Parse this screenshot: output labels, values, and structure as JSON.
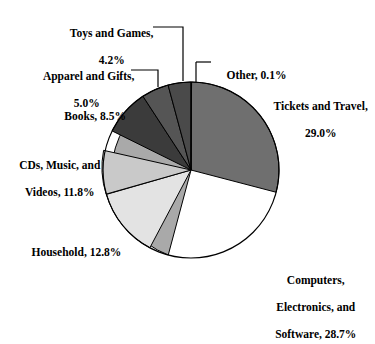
{
  "chart_data": {
    "type": "pie",
    "title": "",
    "subtitle": "",
    "xlabel": "",
    "ylabel": "",
    "legend_position": "none",
    "grid": false,
    "units": "percent",
    "start_angle_deg": 0,
    "direction": "clockwise",
    "categories": [
      "Other",
      "Tickets and Travel",
      "Computers, Electronics, and Software",
      "Household",
      "CDs, Music, and Videos",
      "Books",
      "Apparel and Gifts",
      "Toys and Games"
    ],
    "values": [
      0.1,
      29.0,
      28.7,
      12.8,
      11.8,
      8.5,
      5.0,
      4.2
    ],
    "slices": [
      {
        "name": "Other",
        "value": 0.1,
        "color": "#6e6e6e"
      },
      {
        "name": "Tickets and Travel",
        "value": 29.0,
        "color": "#6f6f6f"
      },
      {
        "name": "Computers, Electronics, and Software",
        "value": 28.7,
        "color": "#a9a9a9"
      },
      {
        "name": "Household",
        "value": 12.8,
        "color": "#e3e3e3"
      },
      {
        "name": "CDs, Music, and Videos",
        "value": 11.8,
        "color": "#c9c9c9"
      },
      {
        "name": "Books",
        "value": 8.5,
        "color": "#3b3b3b"
      },
      {
        "name": "Apparel and Gifts",
        "value": 5.0,
        "color": "#555555"
      },
      {
        "name": "Toys and Games",
        "value": 4.2,
        "color": "#4a4a4a"
      }
    ]
  },
  "labels": {
    "toys_and_games": {
      "line1": "Toys and Games,",
      "line2": "4.2%"
    },
    "apparel": {
      "line1": "Apparel and Gifts,",
      "line2": "5.0%"
    },
    "books": {
      "line1": "Books, 8.5%"
    },
    "cds": {
      "line1": "CDs, Music, and",
      "line2": "Videos, 11.8%"
    },
    "household": {
      "line1": "Household, 12.8%"
    },
    "other": {
      "line1": "Other, 0.1%"
    },
    "tickets": {
      "line1": "Tickets and Travel,",
      "line2": "29.0%"
    },
    "computers": {
      "line1": "Computers,",
      "line2": "Electronics, and",
      "line3": "Software, 28.7%"
    }
  },
  "style": {
    "slice_outline": "#000000",
    "leader_line": "#000000",
    "background": "#ffffff",
    "text": "#000000"
  }
}
